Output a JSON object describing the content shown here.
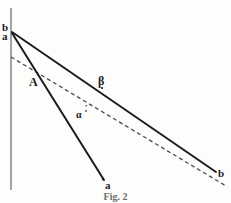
{
  "figure": {
    "caption": "Fig. 2",
    "background_color": "#fdfdfc",
    "ink_color": "#1c1c1c",
    "axis_color": "#7d7d7d",
    "labels": {
      "apex_upper": "b",
      "apex_lower": "a",
      "point_A": "A",
      "point_beta": "β",
      "point_alpha": "α",
      "alpha_prime": "′",
      "endpoint_a": "a",
      "endpoint_b": "b"
    }
  },
  "chart_data": {
    "type": "line",
    "title": "Fig. 2",
    "xlabel": "",
    "ylabel": "",
    "grid": false,
    "legend": "none",
    "xlim": [
      0,
      231
    ],
    "ylim": [
      203,
      0
    ],
    "axes": {
      "vertical_axis": {
        "x": 11,
        "y_top": 8,
        "y_bottom": 190,
        "color": "#7d7d7d",
        "width": 1.4
      }
    },
    "series": [
      {
        "name": "line-a-steep",
        "style": "solid",
        "color": "#1c1c1c",
        "width": 2.0,
        "points": [
          [
            12,
            33
          ],
          [
            104,
            180
          ]
        ],
        "start_label": "a",
        "end_label": "a"
      },
      {
        "name": "line-b-shallow",
        "style": "solid",
        "color": "#1c1c1c",
        "width": 2.0,
        "points": [
          [
            12,
            32
          ],
          [
            216,
            172
          ]
        ],
        "start_label": "b",
        "end_label": "b"
      },
      {
        "name": "line-alpha-dashed",
        "style": "dashed",
        "color": "#4a4a4a",
        "width": 1.3,
        "dash": [
          4,
          3
        ],
        "points": [
          [
            11,
            57
          ],
          [
            226,
            186
          ]
        ]
      }
    ],
    "annotations": [
      {
        "text": "b",
        "x": 4,
        "y": 27,
        "ref": "apex"
      },
      {
        "text": "a",
        "x": 4,
        "y": 36,
        "ref": "apex"
      },
      {
        "text": "A",
        "x": 33,
        "y": 82,
        "ref": "intersection of steep line and dashed line"
      },
      {
        "text": "β",
        "x": 101,
        "y": 81,
        "ref": "point on shallow solid line"
      },
      {
        "text": "α′",
        "x": 80,
        "y": 114,
        "ref": "point on dashed line"
      },
      {
        "text": "a",
        "x": 108,
        "y": 186,
        "ref": "lower endpoint of steep line"
      },
      {
        "text": "b",
        "x": 221,
        "y": 174,
        "ref": "right endpoint of shallow line"
      }
    ]
  }
}
